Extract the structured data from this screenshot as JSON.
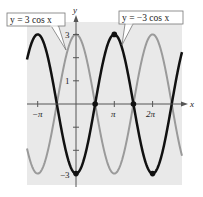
{
  "chart_data": {
    "type": "line",
    "title": "",
    "xlabel": "x",
    "ylabel": "y",
    "xlim": [
      -4.0,
      8.1
    ],
    "ylim": [
      -3.3,
      3.3
    ],
    "x_ticks": [
      {
        "value": -3.14159,
        "label": "−π"
      },
      {
        "value": 3.14159,
        "label": "π"
      },
      {
        "value": 6.28318,
        "label": "2π"
      }
    ],
    "y_ticks": [
      {
        "value": 3,
        "label": "3"
      },
      {
        "value": 2,
        "label": ""
      },
      {
        "value": 1,
        "label": "1"
      },
      {
        "value": -1,
        "label": ""
      },
      {
        "value": -2,
        "label": ""
      },
      {
        "value": -3,
        "label": "−3"
      }
    ],
    "series": [
      {
        "name": "y = 3 cos x",
        "function": "3*cos(x)",
        "color": "#9a9a9a",
        "line_width": 2
      },
      {
        "name": "y = −3 cos x",
        "function": "-3*cos(x)",
        "color": "#111111",
        "line_width": 2.5
      }
    ],
    "marked_points": [
      {
        "x": 0,
        "y": -3
      },
      {
        "x": 1.5708,
        "y": 0
      },
      {
        "x": 3.14159,
        "y": 3
      },
      {
        "x": 4.71239,
        "y": 0
      },
      {
        "x": 6.28318,
        "y": -3
      }
    ],
    "annotations": [
      {
        "text": "y = 3 cos x",
        "points_to": "gray curve"
      },
      {
        "text": "y = −3 cos x",
        "points_to": "black curve"
      }
    ],
    "grid": false,
    "background": "#e8e8e8"
  },
  "labels": {
    "callout_left": "y = 3 cos x",
    "callout_right": "y = −3 cos x",
    "axis_x": "x",
    "axis_y": "y",
    "tick_neg_pi": "−π",
    "tick_pi": "π",
    "tick_2pi": "2π",
    "tick_3": "3",
    "tick_1": "1",
    "tick_neg3": "−3"
  }
}
